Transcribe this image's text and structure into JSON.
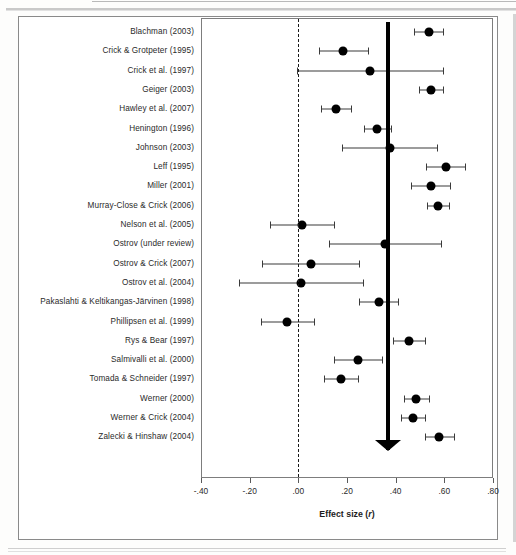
{
  "figure": {
    "axis_title": "Effect size (r)",
    "axis_title_main": "Effect size (",
    "axis_title_var": "r",
    "axis_title_close": ")"
  },
  "chart_data": {
    "type": "scatter",
    "subtype": "forest-plot",
    "title": "",
    "xlabel": "Effect size (r)",
    "ylabel": "",
    "xlim": [
      -0.4,
      0.8
    ],
    "xticks": [
      -0.4,
      -0.2,
      0.0,
      0.2,
      0.4,
      0.6,
      0.8
    ],
    "xtick_labels": [
      "-.40",
      "-.20",
      ".00",
      ".20",
      ".40",
      ".60",
      ".80"
    ],
    "grid": false,
    "legend": "none",
    "reference_line": 0.0,
    "pooled_effect": 0.37,
    "categories": [
      "Blachman (2003)",
      "Crick & Grotpeter (1995)",
      "Crick et al. (1997)",
      "Geiger (2003)",
      "Hawley et al. (2007)",
      "Henington (1996)",
      "Johnson (2003)",
      "Leff (1995)",
      "Miller (2001)",
      "Murray-Close & Crick (2006)",
      "Nelson et al. (2005)",
      "Ostrov (under review)",
      "Ostrov & Crick (2007)",
      "Ostrov et al. (2004)",
      "Pakaslahti & Keltikangas-Järvinen (1998)",
      "Phillipsen et al. (1999)",
      "Rys & Bear (1997)",
      "Salmivalli et al. (2000)",
      "Tomada & Schneider (1997)",
      "Werner (2000)",
      "Werner & Crick (2004)",
      "Zalecki & Hinshaw (2004)"
    ],
    "values": [
      0.535,
      0.185,
      0.295,
      0.545,
      0.155,
      0.325,
      0.375,
      0.605,
      0.545,
      0.575,
      0.015,
      0.355,
      0.05,
      0.01,
      0.33,
      -0.045,
      0.455,
      0.245,
      0.175,
      0.485,
      0.47,
      0.58
    ],
    "ci_lower": [
      0.475,
      0.085,
      -0.005,
      0.495,
      0.095,
      0.27,
      0.18,
      0.525,
      0.465,
      0.53,
      -0.115,
      0.125,
      -0.15,
      -0.245,
      0.25,
      -0.155,
      0.39,
      0.145,
      0.105,
      0.435,
      0.42,
      0.52
    ],
    "ci_upper": [
      0.595,
      0.285,
      0.595,
      0.595,
      0.215,
      0.38,
      0.57,
      0.685,
      0.625,
      0.62,
      0.145,
      0.585,
      0.25,
      0.265,
      0.41,
      0.065,
      0.52,
      0.345,
      0.245,
      0.535,
      0.52,
      0.64
    ],
    "summary": {
      "label": "",
      "effect": 0.37,
      "ci_lower": 0.315,
      "ci_upper": 0.425
    }
  }
}
